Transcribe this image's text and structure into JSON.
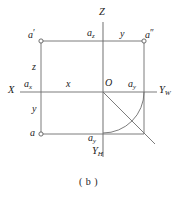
{
  "figure": {
    "caption": "( b )",
    "colors": {
      "line": "#6e6e6e",
      "axis": "#7a7a7a",
      "text": "#222222",
      "background": "#ffffff"
    },
    "axes": [
      {
        "id": "x-axis",
        "label": "X",
        "label_parts": {
          "base": "X",
          "sub": ""
        }
      },
      {
        "id": "z-axis",
        "label": "Z",
        "label_parts": {
          "base": "Z",
          "sub": ""
        }
      },
      {
        "id": "yw-axis",
        "label": "YW",
        "label_parts": {
          "base": "Y",
          "sub": "W"
        }
      },
      {
        "id": "yh-axis",
        "label": "YH",
        "label_parts": {
          "base": "Y",
          "sub": "H"
        }
      }
    ],
    "points": [
      {
        "id": "a-front",
        "base": "a",
        "prime": "′",
        "sub": ""
      },
      {
        "id": "a-side",
        "base": "a",
        "prime": "″",
        "sub": ""
      },
      {
        "id": "a-top",
        "base": "a",
        "prime": "",
        "sub": ""
      },
      {
        "id": "a-x",
        "base": "a",
        "prime": "",
        "sub": "x"
      },
      {
        "id": "a-z",
        "base": "a",
        "prime": "",
        "sub": "z"
      },
      {
        "id": "a-y-right",
        "base": "a",
        "prime": "",
        "sub": "y"
      },
      {
        "id": "a-y-bottom",
        "base": "a",
        "prime": "",
        "sub": "y"
      }
    ],
    "dimensions": [
      {
        "id": "dim-z",
        "label": "z"
      },
      {
        "id": "dim-y-left",
        "label": "y"
      },
      {
        "id": "dim-x",
        "label": "x"
      },
      {
        "id": "dim-y-top",
        "label": "y"
      }
    ],
    "origin_label": "O"
  },
  "labels": {
    "axis_x": "X",
    "axis_z": "Z",
    "axis_yw_base": "Y",
    "axis_yw_sub": "W",
    "axis_yh_base": "Y",
    "axis_yh_sub": "H",
    "origin": "O",
    "a_prime_base": "a",
    "a_prime_mark": "′",
    "a_dprime_base": "a",
    "a_dprime_mark": "″",
    "a_plain": "a",
    "ax_base": "a",
    "ax_sub": "x",
    "az_base": "a",
    "az_sub": "z",
    "ay_right_base": "a",
    "ay_right_sub": "y",
    "ay_bottom_base": "a",
    "ay_bottom_sub": "y",
    "dim_z": "z",
    "dim_y_left": "y",
    "dim_x": "x",
    "dim_y_top": "y",
    "caption": "( b )"
  }
}
